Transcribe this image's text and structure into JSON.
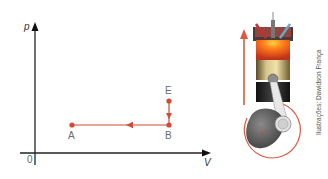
{
  "diagram": {
    "type": "pV diagram",
    "axes": {
      "y_label": "p",
      "x_label": "V",
      "origin_label": "0"
    },
    "points": [
      {
        "label": "E",
        "x": 169,
        "y": 101
      },
      {
        "label": "B",
        "x": 169,
        "y": 125
      },
      {
        "label": "A",
        "x": 72,
        "y": 125
      }
    ],
    "paths": [
      {
        "from": "E",
        "to": "B",
        "direction": "down"
      },
      {
        "from": "B",
        "to": "A",
        "direction": "left"
      }
    ],
    "line_color": "#d24a35"
  },
  "illustration": {
    "subject": "piston-engine-cylinder",
    "credit": "Ilustrações: Dawidson França",
    "arrow_color": "#e0583e"
  }
}
